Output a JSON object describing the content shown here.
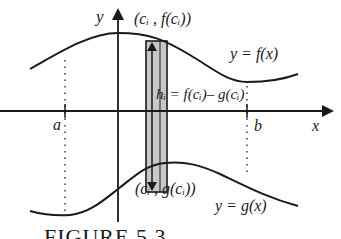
{
  "diagram": {
    "axes": {
      "x_label": "x",
      "y_label": "y"
    },
    "bounds": {
      "left_label": "a",
      "right_label": "b"
    },
    "curves": {
      "upper_label": "y = f(x)",
      "lower_label": "y = g(x)"
    },
    "rectangle": {
      "top_point_label": "(cᵢ , f(cᵢ))",
      "bottom_point_label": "(cᵢ , g(cᵢ))",
      "height_label": "hᵢ = f(cᵢ)– g(cᵢ)",
      "fill_color": "#c8c8c8"
    },
    "caption": "FIGURE 5.3"
  }
}
